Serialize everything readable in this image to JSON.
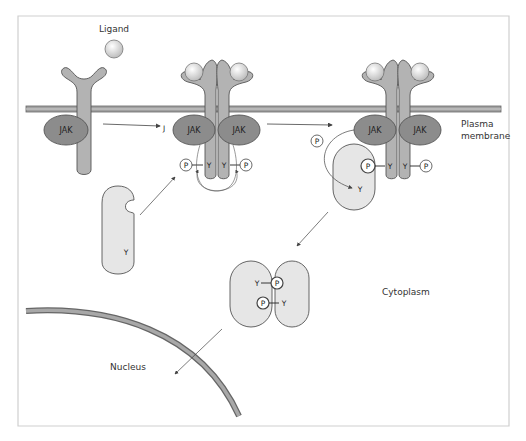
{
  "labels": {
    "ligand": "Ligand",
    "plasma_membrane_line1": "Plasma",
    "plasma_membrane_line2": "membrane",
    "cytoplasm": "Cytoplasm",
    "nucleus": "Nucleus",
    "jak": "JAK",
    "phosphate": "P",
    "tyrosine": "Y",
    "stray_mark": "J"
  },
  "colors": {
    "receptor": "#b3b3b3",
    "jak": "#8c8c8c",
    "stat": "#e6e6e6",
    "ligand": "#d9d9d9",
    "membrane": "#9a9a9a",
    "outline": "#555555",
    "arrow": "#444444",
    "frame": "#cfcfcf"
  }
}
